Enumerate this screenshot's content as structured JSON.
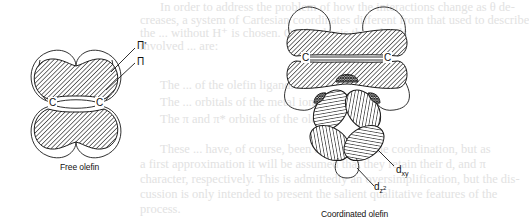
{
  "figure": {
    "left_panel": {
      "caption": "Free olefin",
      "atoms": [
        "C",
        "C"
      ],
      "labels": {
        "pi_star": "Π",
        "pi_star_mark": "*",
        "pi": "Π"
      }
    },
    "right_panel": {
      "caption": "Coordinated olefin",
      "atoms": [
        "C",
        "C"
      ],
      "labels": {
        "dxy_base": "d",
        "dxy_sub": "xy",
        "dz2_base": "d",
        "dz2_sub": "z",
        "dz2_sup": "2"
      }
    },
    "colors": {
      "line": "#1a1a1a",
      "hatch": "#2a2a2a",
      "background": "#ffffff",
      "show_through_text": "#e2e2e2"
    }
  },
  "show_through_text": [
    "In order to address the problem of how the interactions change as θ de-",
    "creases, a system of Cartesian coordinates different from that used to describe",
    "the ... without H⁺ is chosen. On this basis the orbitals",
    "involved ... are:",
    "The ... of the olefin ligand.",
    "The ... orbitals of the metal ion.",
    "The π and π* orbitals of the olefin.",
    "These ... have, of course, been affected by the coordination, but as",
    "a first approximation it will be assumed that they retain their d, and π",
    "character, respectively. This is admittedly an oversimplification, but the dis-",
    "cussion is only intended to present the salient qualitative features of the",
    "process."
  ]
}
